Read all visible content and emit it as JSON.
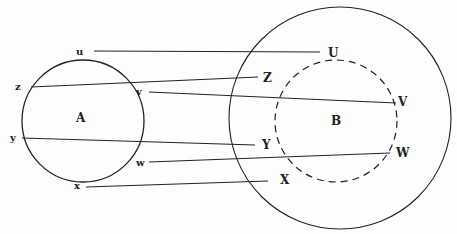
{
  "diagram": {
    "sets": {
      "A": {
        "label": "A",
        "center": [
          83,
          120
        ],
        "r": 61,
        "style": "solid"
      },
      "outer": {
        "label": "",
        "center": [
          340,
          118
        ],
        "r": 111,
        "style": "solid"
      },
      "B": {
        "label": "B",
        "center": [
          336,
          120
        ],
        "r": 62,
        "style": "dashed"
      }
    },
    "mappings": [
      {
        "from": "u",
        "to": "U"
      },
      {
        "from": "z",
        "to": "Z"
      },
      {
        "from": "v",
        "to": "V"
      },
      {
        "from": "y",
        "to": "Y"
      },
      {
        "from": "w",
        "to": "W"
      },
      {
        "from": "x",
        "to": "X"
      }
    ],
    "labels": {
      "A": "A",
      "B": "B",
      "u": "u",
      "z": "z",
      "v": "v",
      "y": "y",
      "w": "w",
      "x": "x",
      "U": "U",
      "Z": "Z",
      "V": "V",
      "Y": "Y",
      "W": "W",
      "X": "X"
    }
  }
}
